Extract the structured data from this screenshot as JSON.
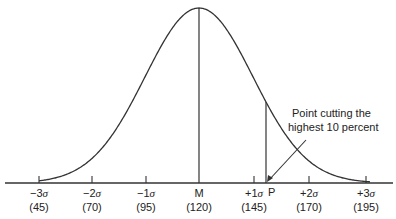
{
  "diagram": {
    "type": "normal-distribution-curve",
    "mean_label": "M",
    "mean_value": "(120)",
    "sigma": 25,
    "ticks": [
      {
        "label": "−3σ",
        "value": "(45)",
        "x": 39
      },
      {
        "label": "−2σ",
        "value": "(70)",
        "x": 92
      },
      {
        "label": "−1σ",
        "value": "(95)",
        "x": 146
      },
      {
        "label": "M",
        "value": "(120)",
        "x": 199
      },
      {
        "label": "+1σ",
        "value": "(145)",
        "x": 254
      },
      {
        "label": "+2σ",
        "value": "(170)",
        "x": 309
      },
      {
        "label": "+3σ",
        "value": "(195)",
        "x": 366
      }
    ],
    "point": {
      "label": "P",
      "x": 266
    },
    "annotation": {
      "line1": "Point cutting the",
      "line2": "highest 10 percent"
    },
    "colors": {
      "line": "#333333",
      "text": "#222222",
      "background": "#ffffff"
    }
  }
}
